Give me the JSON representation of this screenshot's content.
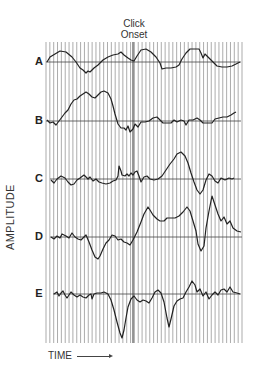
{
  "figure": {
    "title_line1": "Click",
    "title_line2": "Onset",
    "ylabel": "AMPLITUDE",
    "xlabel": "TIME",
    "trace_labels": [
      "A",
      "B",
      "C",
      "D",
      "E"
    ]
  },
  "chart_data": {
    "type": "line",
    "xlabel": "TIME",
    "ylabel": "AMPLITUDE",
    "grid": {
      "vertical_lines": 52,
      "x_start": 46,
      "x_end": 242,
      "y_top": 42,
      "y_bottom": 343
    },
    "onset_x": 133,
    "series": [
      {
        "name": "A",
        "baseline_y": 62,
        "points": [
          [
            47,
            62
          ],
          [
            50,
            57
          ],
          [
            55,
            54
          ],
          [
            60,
            51
          ],
          [
            66,
            52
          ],
          [
            72,
            57
          ],
          [
            76,
            62
          ],
          [
            80,
            68
          ],
          [
            83,
            70
          ],
          [
            86,
            73
          ],
          [
            88,
            71
          ],
          [
            90,
            72
          ],
          [
            94,
            68
          ],
          [
            98,
            65
          ],
          [
            103,
            60
          ],
          [
            108,
            57
          ],
          [
            113,
            55
          ],
          [
            118,
            54
          ],
          [
            121,
            52
          ],
          [
            124,
            55
          ],
          [
            128,
            58
          ],
          [
            131,
            60
          ],
          [
            134,
            61
          ],
          [
            137,
            56
          ],
          [
            141,
            50
          ],
          [
            146,
            49
          ],
          [
            151,
            52
          ],
          [
            156,
            57
          ],
          [
            160,
            63
          ],
          [
            162,
            69
          ],
          [
            166,
            68
          ],
          [
            171,
            68
          ],
          [
            176,
            67
          ],
          [
            179,
            65
          ],
          [
            182,
            59
          ],
          [
            186,
            53
          ],
          [
            190,
            49
          ],
          [
            195,
            49
          ],
          [
            199,
            49
          ],
          [
            201,
            53
          ],
          [
            203,
            58
          ],
          [
            205,
            54
          ],
          [
            208,
            57
          ],
          [
            212,
            61
          ],
          [
            217,
            66
          ],
          [
            222,
            67
          ],
          [
            227,
            67
          ],
          [
            232,
            66
          ],
          [
            236,
            64
          ],
          [
            240,
            62
          ]
        ]
      },
      {
        "name": "B",
        "baseline_y": 121,
        "points": [
          [
            47,
            120
          ],
          [
            50,
            123
          ],
          [
            53,
            122
          ],
          [
            56,
            125
          ],
          [
            59,
            121
          ],
          [
            62,
            117
          ],
          [
            65,
            113
          ],
          [
            68,
            110
          ],
          [
            71,
            104
          ],
          [
            74,
            100
          ],
          [
            77,
            99
          ],
          [
            80,
            96
          ],
          [
            83,
            94
          ],
          [
            86,
            92
          ],
          [
            89,
            94
          ],
          [
            92,
            97
          ],
          [
            95,
            98
          ],
          [
            98,
            95
          ],
          [
            101,
            92
          ],
          [
            104,
            91
          ],
          [
            108,
            93
          ],
          [
            111,
            99
          ],
          [
            113,
            106
          ],
          [
            115,
            114
          ],
          [
            118,
            124
          ],
          [
            121,
            128
          ],
          [
            124,
            128
          ],
          [
            126,
            130
          ],
          [
            128,
            126
          ],
          [
            130,
            132
          ],
          [
            133,
            129
          ],
          [
            135,
            124
          ],
          [
            138,
            127
          ],
          [
            141,
            122
          ],
          [
            145,
            122
          ],
          [
            149,
            121
          ],
          [
            153,
            118
          ],
          [
            157,
            117
          ],
          [
            160,
            120
          ],
          [
            163,
            123
          ],
          [
            167,
            123
          ],
          [
            171,
            123
          ],
          [
            174,
            120
          ],
          [
            177,
            122
          ],
          [
            181,
            120
          ],
          [
            184,
            121
          ],
          [
            186,
            125
          ],
          [
            189,
            120
          ],
          [
            193,
            120
          ],
          [
            197,
            118
          ],
          [
            200,
            120
          ],
          [
            203,
            123
          ],
          [
            207,
            123
          ],
          [
            212,
            123
          ],
          [
            215,
            119
          ],
          [
            219,
            118
          ],
          [
            223,
            117
          ],
          [
            227,
            117
          ],
          [
            231,
            115
          ],
          [
            234,
            113
          ],
          [
            236,
            112
          ]
        ]
      },
      {
        "name": "C",
        "baseline_y": 179,
        "points": [
          [
            51,
            180
          ],
          [
            54,
            183
          ],
          [
            57,
            179
          ],
          [
            61,
            176
          ],
          [
            65,
            178
          ],
          [
            68,
            182
          ],
          [
            71,
            185
          ],
          [
            74,
            184
          ],
          [
            77,
            180
          ],
          [
            80,
            178
          ],
          [
            84,
            175
          ],
          [
            88,
            179
          ],
          [
            90,
            177
          ],
          [
            93,
            181
          ],
          [
            96,
            179
          ],
          [
            99,
            182
          ],
          [
            102,
            183
          ],
          [
            106,
            184
          ],
          [
            110,
            183
          ],
          [
            113,
            181
          ],
          [
            116,
            180
          ],
          [
            118,
            176
          ],
          [
            119,
            166
          ],
          [
            121,
            171
          ],
          [
            122,
            175
          ],
          [
            125,
            176
          ],
          [
            127,
            174
          ],
          [
            129,
            176
          ],
          [
            131,
            173
          ],
          [
            133,
            175
          ],
          [
            135,
            172
          ],
          [
            137,
            171
          ],
          [
            139,
            176
          ],
          [
            141,
            182
          ],
          [
            144,
            177
          ],
          [
            147,
            176
          ],
          [
            150,
            179
          ],
          [
            154,
            180
          ],
          [
            158,
            179
          ],
          [
            162,
            176
          ],
          [
            166,
            170
          ],
          [
            170,
            164
          ],
          [
            174,
            159
          ],
          [
            177,
            154
          ],
          [
            181,
            152
          ],
          [
            185,
            156
          ],
          [
            188,
            163
          ],
          [
            191,
            173
          ],
          [
            194,
            182
          ],
          [
            197,
            190
          ],
          [
            200,
            194
          ],
          [
            203,
            190
          ],
          [
            206,
            180
          ],
          [
            209,
            174
          ],
          [
            212,
            176
          ],
          [
            215,
            181
          ],
          [
            218,
            183
          ],
          [
            221,
            178
          ],
          [
            225,
            180
          ],
          [
            229,
            178
          ],
          [
            232,
            179
          ],
          [
            234,
            178
          ]
        ]
      },
      {
        "name": "D",
        "baseline_y": 237,
        "points": [
          [
            51,
            237
          ],
          [
            54,
            239
          ],
          [
            57,
            236
          ],
          [
            60,
            238
          ],
          [
            62,
            234
          ],
          [
            66,
            236
          ],
          [
            69,
            238
          ],
          [
            72,
            233
          ],
          [
            75,
            237
          ],
          [
            78,
            239
          ],
          [
            81,
            240
          ],
          [
            84,
            237
          ],
          [
            86,
            235
          ],
          [
            89,
            242
          ],
          [
            92,
            250
          ],
          [
            95,
            257
          ],
          [
            98,
            259
          ],
          [
            100,
            256
          ],
          [
            103,
            249
          ],
          [
            106,
            243
          ],
          [
            109,
            240
          ],
          [
            112,
            235
          ],
          [
            115,
            236
          ],
          [
            118,
            240
          ],
          [
            121,
            239
          ],
          [
            124,
            242
          ],
          [
            127,
            243
          ],
          [
            130,
            245
          ],
          [
            133,
            240
          ],
          [
            137,
            232
          ],
          [
            141,
            222
          ],
          [
            144,
            214
          ],
          [
            148,
            207
          ],
          [
            150,
            210
          ],
          [
            153,
            215
          ],
          [
            157,
            219
          ],
          [
            160,
            221
          ],
          [
            164,
            221
          ],
          [
            167,
            218
          ],
          [
            171,
            218
          ],
          [
            175,
            218
          ],
          [
            179,
            216
          ],
          [
            183,
            212
          ],
          [
            187,
            207
          ],
          [
            190,
            211
          ],
          [
            193,
            221
          ],
          [
            196,
            231
          ],
          [
            198,
            244
          ],
          [
            201,
            251
          ],
          [
            204,
            246
          ],
          [
            206,
            228
          ],
          [
            209,
            211
          ],
          [
            212,
            196
          ],
          [
            215,
            205
          ],
          [
            218,
            214
          ],
          [
            221,
            221
          ],
          [
            224,
            217
          ],
          [
            227,
            224
          ],
          [
            230,
            221
          ],
          [
            233,
            228
          ],
          [
            237,
            231
          ],
          [
            241,
            232
          ]
        ]
      },
      {
        "name": "E",
        "baseline_y": 294,
        "points": [
          [
            54,
            294
          ],
          [
            57,
            292
          ],
          [
            59,
            296
          ],
          [
            61,
            293
          ],
          [
            63,
            291
          ],
          [
            65,
            295
          ],
          [
            67,
            298
          ],
          [
            69,
            295
          ],
          [
            71,
            292
          ],
          [
            74,
            295
          ],
          [
            77,
            297
          ],
          [
            80,
            295
          ],
          [
            83,
            297
          ],
          [
            86,
            298
          ],
          [
            89,
            295
          ],
          [
            91,
            294
          ],
          [
            92,
            299
          ],
          [
            94,
            294
          ],
          [
            97,
            293
          ],
          [
            101,
            293
          ],
          [
            104,
            292
          ],
          [
            108,
            294
          ],
          [
            111,
            300
          ],
          [
            114,
            310
          ],
          [
            117,
            322
          ],
          [
            120,
            333
          ],
          [
            122,
            338
          ],
          [
            124,
            330
          ],
          [
            126,
            318
          ],
          [
            128,
            307
          ],
          [
            131,
            299
          ],
          [
            134,
            296
          ],
          [
            137,
            300
          ],
          [
            140,
            302
          ],
          [
            143,
            300
          ],
          [
            146,
            301
          ],
          [
            149,
            303
          ],
          [
            152,
            298
          ],
          [
            155,
            292
          ],
          [
            158,
            290
          ],
          [
            161,
            293
          ],
          [
            164,
            302
          ],
          [
            167,
            318
          ],
          [
            169,
            327
          ],
          [
            171,
            319
          ],
          [
            174,
            306
          ],
          [
            177,
            301
          ],
          [
            180,
            299
          ],
          [
            183,
            298
          ],
          [
            186,
            292
          ],
          [
            189,
            287
          ],
          [
            192,
            281
          ],
          [
            195,
            285
          ],
          [
            197,
            292
          ],
          [
            200,
            289
          ],
          [
            203,
            296
          ],
          [
            206,
            292
          ],
          [
            209,
            299
          ],
          [
            212,
            295
          ],
          [
            215,
            292
          ],
          [
            218,
            295
          ],
          [
            221,
            290
          ],
          [
            224,
            289
          ],
          [
            227,
            292
          ],
          [
            230,
            287
          ],
          [
            233,
            292
          ],
          [
            237,
            293
          ],
          [
            240,
            294
          ]
        ]
      }
    ],
    "colors": {
      "trace": "#222222",
      "grid": "#888888",
      "onset_line": "#333333",
      "baseline": "#444444"
    }
  }
}
